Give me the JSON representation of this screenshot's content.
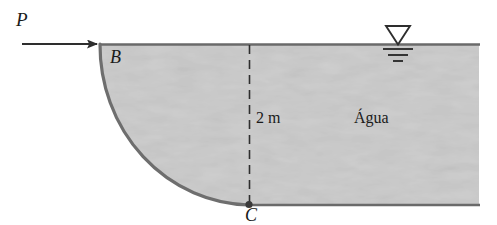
{
  "figure": {
    "background_color": "#ffffff",
    "water_fill_color": "#d2d2d2",
    "line_color": "#5a5a5a",
    "text_color": "#1a1a1a"
  },
  "labels": {
    "force": "P",
    "point_top": "B",
    "point_bottom": "C",
    "depth": "2 m",
    "fluid": "Água"
  },
  "icons": {
    "force_arrow": "right-arrow-icon",
    "water_level": "water-level-icon",
    "point_marker": "point-marker-icon",
    "dimension_line": "dashed-dimension-line-icon",
    "curved_gate": "quarter-circle-arc-icon"
  },
  "geometry": {
    "water_surface_y": 44,
    "bottom_y": 205,
    "gate_top_x": 100,
    "gate_bottom_x": 249,
    "water_right_x": 479,
    "arrow_start_x": 22,
    "arrow_end_x": 100,
    "arrow_y": 44,
    "depth_value": 2,
    "depth_unit": "m"
  }
}
